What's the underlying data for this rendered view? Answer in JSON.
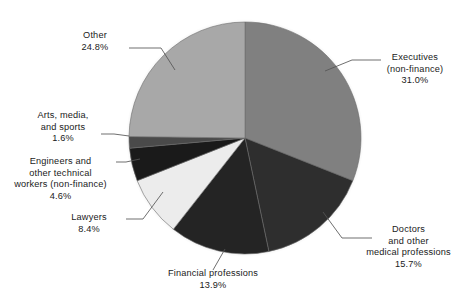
{
  "chart_data": {
    "type": "pie",
    "title": "",
    "subtitle": "",
    "xlabel": "",
    "ylabel": "",
    "legend_position": "none",
    "grid": false,
    "units": "percent",
    "start_angle_deg": 90,
    "direction": "clockwise",
    "categories": [
      "Executives (non-finance)",
      "Doctors and other medical professions",
      "Financial professions",
      "Lawyers",
      "Engineers and other technical workers (non-finance)",
      "Arts, media, and sports",
      "Other"
    ],
    "values": [
      31.0,
      15.7,
      13.9,
      8.4,
      4.6,
      1.6,
      24.8
    ],
    "slices": [
      {
        "key": "executives",
        "name": "Executives (non-finance)",
        "value": 31.0,
        "value_label": "31.0%",
        "color": "#808080",
        "label_lines": [
          "Executives",
          "(non-finance)",
          "31.0%"
        ]
      },
      {
        "key": "doctors",
        "name": "Doctors and other medical professions",
        "value": 15.7,
        "value_label": "15.7%",
        "color": "#2e2e2e",
        "label_lines": [
          "Doctors",
          "and other",
          "medical professions",
          "15.7%"
        ]
      },
      {
        "key": "financial",
        "name": "Financial professions",
        "value": 13.9,
        "value_label": "13.9%",
        "color": "#242424",
        "label_lines": [
          "Financial professions",
          "13.9%"
        ]
      },
      {
        "key": "lawyers",
        "name": "Lawyers",
        "value": 8.4,
        "value_label": "8.4%",
        "color": "#ececec",
        "label_lines": [
          "Lawyers",
          "8.4%"
        ]
      },
      {
        "key": "engineers",
        "name": "Engineers and other technical workers (non-finance)",
        "value": 4.6,
        "value_label": "4.6%",
        "color": "#1a1a1a",
        "label_lines": [
          "Engineers and",
          "other technical",
          "workers (non-finance)",
          "4.6%"
        ]
      },
      {
        "key": "arts",
        "name": "Arts, media, and sports",
        "value": 1.6,
        "value_label": "1.6%",
        "color": "#4a4a4a",
        "label_lines": [
          "Arts, media,",
          "and sports",
          "1.6%"
        ]
      },
      {
        "key": "other",
        "name": "Other",
        "value": 24.8,
        "value_label": "24.8%",
        "color": "#a8a8a8",
        "label_lines": [
          "Other",
          "24.8%"
        ]
      }
    ]
  },
  "labels": {
    "executives": "Executives\n(non-finance)\n31.0%",
    "doctors": "Doctors\nand other\nmedical professions\n15.7%",
    "financial": "Financial professions\n13.9%",
    "lawyers": "Lawyers\n8.4%",
    "engineers": "Engineers and\nother technical\nworkers (non-finance)\n4.6%",
    "arts": "Arts, media,\nand sports\n1.6%",
    "other": "Other\n24.8%"
  }
}
